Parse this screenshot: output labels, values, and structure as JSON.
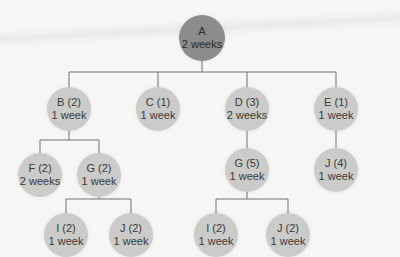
{
  "diagram": {
    "type": "tree",
    "nodes": {
      "a": {
        "label": "A",
        "duration": "2 weeks"
      },
      "b": {
        "label": "B (2)",
        "duration": "1 week"
      },
      "c": {
        "label": "C (1)",
        "duration": "1 week"
      },
      "d": {
        "label": "D (3)",
        "duration": "2 weeks"
      },
      "e": {
        "label": "E (1)",
        "duration": "1 week"
      },
      "f": {
        "label": "F (2)",
        "duration": "2 weeks"
      },
      "g2": {
        "label": "G (2)",
        "duration": "1 week"
      },
      "g5": {
        "label": "G (5)",
        "duration": "1 week"
      },
      "j4": {
        "label": "J (4)",
        "duration": "1 week"
      },
      "i2a": {
        "label": "I (2)",
        "duration": "1 week"
      },
      "j2a": {
        "label": "J (2)",
        "duration": "1 week"
      },
      "i2b": {
        "label": "I (2)",
        "duration": "1 week"
      },
      "j2b": {
        "label": "J (2)",
        "duration": "1 week"
      }
    },
    "edges": [
      [
        "A",
        "B (2)"
      ],
      [
        "A",
        "C (1)"
      ],
      [
        "A",
        "D (3)"
      ],
      [
        "A",
        "E (1)"
      ],
      [
        "B (2)",
        "F (2)"
      ],
      [
        "B (2)",
        "G (2)"
      ],
      [
        "G (2)",
        "I (2)"
      ],
      [
        "G (2)",
        "J (2)"
      ],
      [
        "D (3)",
        "G (5)"
      ],
      [
        "G (5)",
        "I (2)"
      ],
      [
        "G (5)",
        "J (2)"
      ],
      [
        "E (1)",
        "J (4)"
      ]
    ],
    "colors": {
      "root_fill": "#8c8c8a",
      "node_fill": "#cbcbc9",
      "line": "#6f6f6f",
      "text": "#3a3a3a"
    }
  }
}
